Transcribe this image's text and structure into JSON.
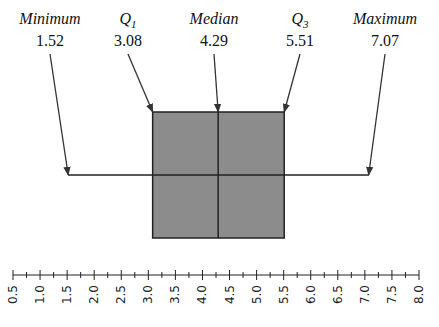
{
  "chart_data": {
    "type": "boxplot",
    "title": "",
    "summary": [
      {
        "key": "min",
        "label": "Minimum",
        "sub": "",
        "value": 1.52,
        "display": "1.52"
      },
      {
        "key": "q1",
        "label": "Q",
        "sub": "1",
        "value": 3.08,
        "display": "3.08"
      },
      {
        "key": "median",
        "label": "Median",
        "sub": "",
        "value": 4.29,
        "display": "4.29"
      },
      {
        "key": "q3",
        "label": "Q",
        "sub": "3",
        "value": 5.51,
        "display": "5.51"
      },
      {
        "key": "max",
        "label": "Maximum",
        "sub": "",
        "value": 7.07,
        "display": "7.07"
      }
    ],
    "axis": {
      "min": 0.5,
      "max": 8.0,
      "major_step": 0.5,
      "minor_step": 0.25,
      "tick_labels": [
        "0.5",
        "1.0",
        "1.5",
        "2.0",
        "2.5",
        "3.0",
        "3.5",
        "4.0",
        "4.5",
        "5.0",
        "5.5",
        "6.0",
        "6.5",
        "7.0",
        "7.5",
        "8.0"
      ]
    },
    "colors": {
      "box_fill": "#8c8c8c",
      "line": "#222222"
    }
  }
}
